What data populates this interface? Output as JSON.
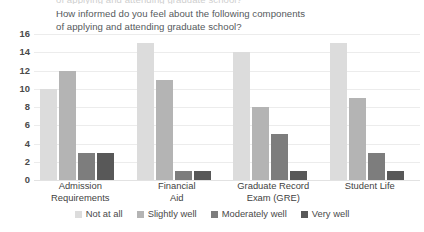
{
  "top_cropped_text": "of applying and attending graduate school?",
  "chart_data": {
    "type": "bar",
    "title": "How informed do you feel about the following components of applying and attending graduate school?",
    "title_line1": "How informed do you feel about the following components",
    "title_line2": "of applying and attending graduate school?",
    "xlabel": "",
    "ylabel": "",
    "ylim": [
      0,
      16
    ],
    "yticks": [
      0,
      2,
      4,
      6,
      8,
      10,
      12,
      14,
      16
    ],
    "grid": true,
    "legend_position": "bottom",
    "categories": [
      "Admission Requirements",
      "Financial Aid",
      "Graduate Record Exam (GRE)",
      "Student Life"
    ],
    "category_lines": [
      [
        "Admission",
        "Requirements"
      ],
      [
        "Financial",
        "Aid"
      ],
      [
        "Graduate Record",
        "Exam (GRE)"
      ],
      [
        "Student Life"
      ]
    ],
    "series": [
      {
        "name": "Not at all",
        "color": "#dcdcdc",
        "values": [
          10,
          15,
          14,
          15
        ]
      },
      {
        "name": "Slightly well",
        "color": "#b4b4b4",
        "values": [
          12,
          11,
          8,
          9
        ]
      },
      {
        "name": "Moderately well",
        "color": "#7d7d7d",
        "values": [
          3,
          1,
          5,
          3
        ]
      },
      {
        "name": "Very well",
        "color": "#585858",
        "values": [
          3,
          1,
          1,
          1
        ]
      }
    ]
  }
}
